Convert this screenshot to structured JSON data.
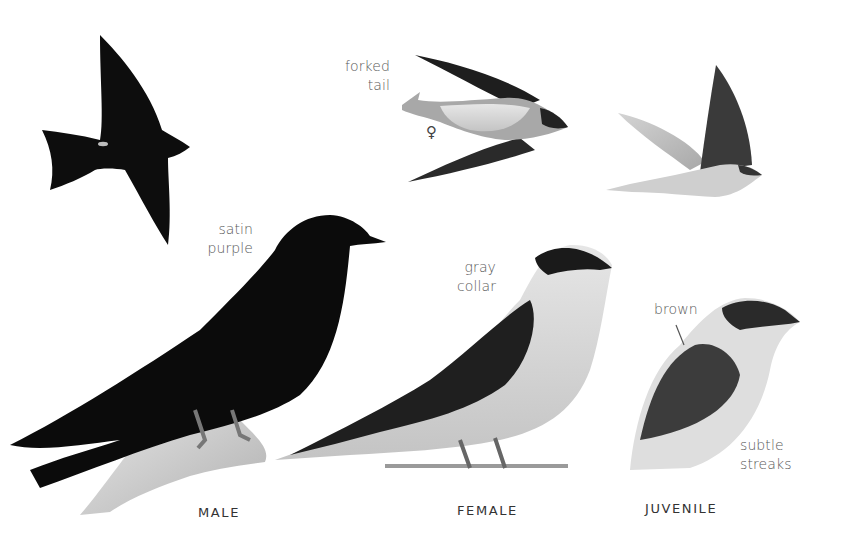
{
  "plate": {
    "subject": "Purple Martin",
    "birds": [
      {
        "id": "male-flight",
        "view": "flight, underside",
        "color": "#0d0d0d"
      },
      {
        "id": "female-flight",
        "view": "flight, underside",
        "color": "#9a9a9a"
      },
      {
        "id": "juvenile-flight",
        "view": "flight, side",
        "color": "#8a8a8a"
      },
      {
        "id": "male-perched",
        "color": "#0b0b0b"
      },
      {
        "id": "female-perched",
        "color": "#bdbdbd"
      },
      {
        "id": "juvenile-bust",
        "color": "#d8d8d8"
      }
    ],
    "annotations": {
      "forked_tail": [
        "forked",
        "tail"
      ],
      "female_symbol": "♀",
      "satin_purple": [
        "satin",
        "purple"
      ],
      "gray_collar": [
        "gray",
        "collar"
      ],
      "brown": "brown",
      "subtle_streaks": [
        "subtle",
        "streaks"
      ]
    },
    "captions": {
      "male": "MALE",
      "female": "FEMALE",
      "juvenile": "JUVENILE"
    },
    "colors": {
      "background": "#ffffff",
      "label_text": "#5a5a5a",
      "caption_text": "#333333",
      "male_plumage": "#0b0b0b",
      "female_back": "#2a2a2a",
      "female_belly": "#d9d9d9"
    }
  }
}
